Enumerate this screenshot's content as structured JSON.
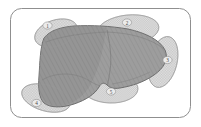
{
  "figure": {
    "frame": {
      "name": "rounded-border-frame",
      "stroke_color": "#8f8f8f",
      "fill_color": "#ffffff",
      "x": 10,
      "y": 8,
      "width": 181,
      "height": 110,
      "corner_radius": 11
    },
    "colors": {
      "liver_fill": "#9a9a9a",
      "liver_stroke": "#6e6e6e",
      "organ_fill": "#d8d8d8",
      "organ_stroke": "#9b9b9b",
      "label_text": "#4a4a4a",
      "label_circle_stroke": "#8a8a8a",
      "background": "#ffffff"
    },
    "main_organ": {
      "name": "liver",
      "label": "liver-outline",
      "shading": "diagonal-hatch"
    },
    "labels": [
      {
        "id": "1",
        "text": "1",
        "x": 47.5,
        "y": 25.5,
        "region": "upper-left"
      },
      {
        "id": "2",
        "text": "2",
        "x": 127.0,
        "y": 22.5,
        "region": "upper-right"
      },
      {
        "id": "3",
        "text": "3",
        "x": 167.5,
        "y": 60.0,
        "region": "right"
      },
      {
        "id": "4",
        "text": "4",
        "x": 36.5,
        "y": 103.0,
        "region": "lower-left"
      },
      {
        "id": "5",
        "text": "5",
        "x": 111.0,
        "y": 91.5,
        "region": "lower-middle"
      }
    ],
    "organ_shapes": [
      {
        "id": "organ-1",
        "name": "organ-ellipse-upper-left",
        "cx": 56,
        "cy": 33,
        "rx": 22,
        "ry": 13,
        "rot": -18
      },
      {
        "id": "organ-2",
        "name": "organ-ellipse-upper-right",
        "cx": 128,
        "cy": 30,
        "rx": 31,
        "ry": 15,
        "rot": -6
      },
      {
        "id": "organ-3",
        "name": "organ-ellipse-right",
        "cx": 163,
        "cy": 62,
        "rx": 14,
        "ry": 26,
        "rot": 14
      },
      {
        "id": "organ-4",
        "name": "organ-ellipse-lower-left",
        "cx": 46,
        "cy": 98,
        "rx": 25,
        "ry": 13,
        "rot": 16
      },
      {
        "id": "organ-5",
        "name": "organ-ellipse-lower-mid",
        "cx": 110,
        "cy": 88,
        "rx": 28,
        "ry": 15,
        "rot": 2
      }
    ]
  }
}
